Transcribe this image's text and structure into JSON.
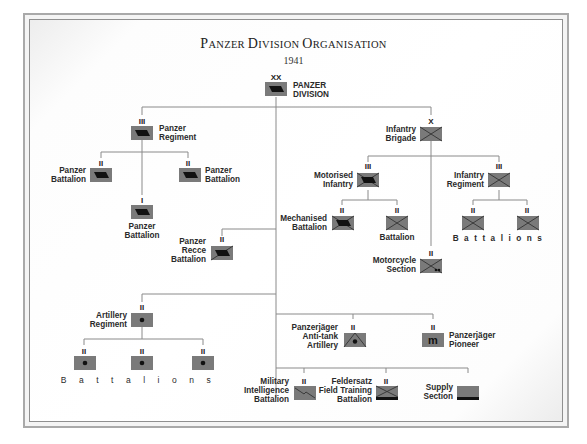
{
  "title": {
    "main_first": "P",
    "main_first_rest": "ANZER ",
    "main_second": "D",
    "main_second_rest": "IVISION ",
    "main_third": "O",
    "main_third_rest": "RGANISATION",
    "year": "1941"
  },
  "colors": {
    "symbol_fill": "#7a7a7a",
    "line": "#8a8a8a",
    "text": "#2a2a2a"
  },
  "units": {
    "division": {
      "echelon": "XX",
      "label": [
        "PANZER",
        "DIVISION"
      ],
      "symbol": "armour-icon"
    },
    "panzer_regiment": {
      "echelon": "III",
      "label": [
        "Panzer",
        "Regiment"
      ],
      "symbol": "armour-icon"
    },
    "panzer_battalion_left": {
      "echelon": "II",
      "label": [
        "Panzer",
        "Battalion"
      ],
      "symbol": "armour-icon"
    },
    "panzer_battalion_right": {
      "echelon": "II",
      "label": [
        "Panzer",
        "Battalion"
      ],
      "symbol": "armour-icon"
    },
    "panzer_battalion_light": {
      "echelon": "I",
      "label": [
        "Panzer",
        "Battalion"
      ],
      "symbol": "armour-icon"
    },
    "infantry_brigade": {
      "echelon": "X",
      "label": [
        "Infantry",
        "Brigade"
      ],
      "symbol": "infantry-icon"
    },
    "motorised_infantry": {
      "echelon": "III",
      "label": [
        "Motorised",
        "Infantry"
      ],
      "symbol": "mechanised-infantry-icon"
    },
    "mechanised_battalion": {
      "echelon": "II",
      "label": [
        "Mechanised",
        "Battalion"
      ],
      "symbol": "mechanised-infantry-icon"
    },
    "battalion": {
      "echelon": "II",
      "label": [
        "Battalion"
      ],
      "symbol": "infantry-icon"
    },
    "infantry_regiment": {
      "echelon": "III",
      "label": [
        "Infantry",
        "Regiment"
      ],
      "symbol": "infantry-icon"
    },
    "infantry_battalion_1": {
      "echelon": "II",
      "symbol": "infantry-icon"
    },
    "infantry_battalion_2": {
      "echelon": "II",
      "symbol": "infantry-icon"
    },
    "infantry_battalions_label": "Battalions",
    "motorcycle_section": {
      "echelon": "II",
      "label": [
        "Motorcycle",
        "Section"
      ],
      "symbol": "motorcycle-infantry-icon"
    },
    "recce_battalion": {
      "echelon": "II",
      "label": [
        "Panzer",
        "Recce",
        "Battalion"
      ],
      "symbol": "armoured-recce-icon"
    },
    "artillery_regiment": {
      "echelon": "II",
      "label": [
        "Artillery",
        "Regiment"
      ],
      "symbol": "artillery-icon"
    },
    "artillery_battalion_1": {
      "echelon": "II",
      "symbol": "artillery-icon"
    },
    "artillery_battalion_2": {
      "echelon": "II",
      "symbol": "artillery-icon"
    },
    "artillery_battalion_3": {
      "echelon": "II",
      "symbol": "artillery-icon"
    },
    "artillery_battalions_label": "Battalions",
    "panzerjager_artillery": {
      "echelon": "II",
      "label": [
        "Panzerjäger",
        "Anti-tank",
        "Artillery"
      ],
      "symbol": "anti-tank-icon"
    },
    "panzerjager_pioneer": {
      "echelon": "II",
      "label": [
        "Panzerjäger",
        "Pioneer"
      ],
      "symbol": "pioneer-icon",
      "glyph": "m"
    },
    "military_intelligence": {
      "echelon": "II",
      "label": [
        "Military",
        "Intelligence",
        "Battalion"
      ],
      "symbol": "signals-icon"
    },
    "feldersatz": {
      "echelon": "II",
      "label": [
        "Feldersatz",
        "Field Training",
        "Battalion"
      ],
      "symbol": "field-training-icon"
    },
    "supply_section": {
      "label": [
        "Supply",
        "Section"
      ],
      "symbol": "supply-icon"
    }
  }
}
